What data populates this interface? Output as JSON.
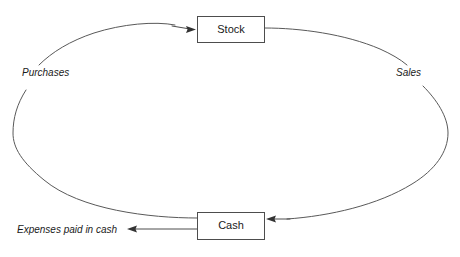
{
  "diagram": {
    "type": "cycle-diagram",
    "background_color": "#ffffff",
    "line_color": "#595959",
    "text_color": "#1a1a1a",
    "nodes": [
      {
        "id": "stock",
        "label": "Stock",
        "shape": "rectangle",
        "x": 197,
        "y": 16,
        "width": 68,
        "height": 27
      },
      {
        "id": "cash",
        "label": "Cash",
        "shape": "rectangle",
        "x": 197,
        "y": 212,
        "width": 68,
        "height": 28
      }
    ],
    "edge_labels": [
      {
        "id": "purchases",
        "label": "Purchases",
        "style": "italic",
        "x": 22,
        "y": 75
      },
      {
        "id": "sales",
        "label": "Sales",
        "style": "italic",
        "x": 396,
        "y": 75
      },
      {
        "id": "expenses",
        "label": "Expenses paid in cash",
        "style": "italic",
        "x": 17,
        "y": 232
      }
    ],
    "edges": [
      {
        "id": "cash-to-stock",
        "from": "cash",
        "to": "stock",
        "label": "Purchases",
        "direction": "counter-clockwise-left",
        "arrowhead": "at-stock"
      },
      {
        "id": "stock-to-cash",
        "from": "stock",
        "to": "cash",
        "label": "Sales",
        "direction": "clockwise-right",
        "arrowhead": "at-cash"
      },
      {
        "id": "cash-to-expenses",
        "from": "cash",
        "to": "expenses",
        "label": "Expenses paid in cash",
        "direction": "left",
        "arrowhead": "at-expenses"
      }
    ]
  }
}
